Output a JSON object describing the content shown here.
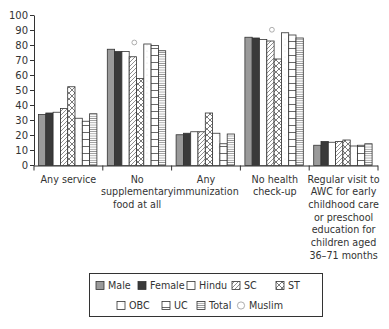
{
  "chart_data": {
    "type": "bar",
    "title": "",
    "xlabel": "",
    "ylabel": "",
    "ylim": [
      0,
      100
    ],
    "yticks": [
      0,
      10,
      20,
      30,
      40,
      50,
      60,
      70,
      80,
      90,
      100
    ],
    "grid": false,
    "legend_position": "bottom",
    "categories": [
      [
        "Any service"
      ],
      [
        "No",
        "supplementary",
        "food at all"
      ],
      [
        "Any",
        "immunization"
      ],
      [
        "No health",
        "check-up"
      ],
      [
        "Regular visit to",
        "AWC for early",
        "childhood care",
        "or preschool",
        "education for",
        "children aged",
        "36–71 months"
      ]
    ],
    "series": [
      {
        "name": "Male",
        "pattern": "gray-fill",
        "values": [
          34,
          77.5,
          20.5,
          85.5,
          13.5
        ]
      },
      {
        "name": "Female",
        "pattern": "dark-fill",
        "values": [
          35,
          76,
          21.5,
          85,
          16
        ]
      },
      {
        "name": "Hindu",
        "pattern": "white",
        "values": [
          35.5,
          76,
          22.5,
          84,
          15.5
        ]
      },
      {
        "name": "SC",
        "pattern": "diagonal-hatch",
        "values": [
          38,
          72.5,
          22.5,
          83,
          16
        ]
      },
      {
        "name": "ST",
        "pattern": "cross-hatch",
        "values": [
          52.5,
          58,
          35,
          71,
          17
        ]
      },
      {
        "name": "OBC",
        "pattern": "white-dotted",
        "values": [
          31.5,
          81,
          21.5,
          88.5,
          13
        ]
      },
      {
        "name": "UC",
        "pattern": "horizontal-lines",
        "values": [
          29.5,
          80,
          14.5,
          87,
          13.5
        ]
      },
      {
        "name": "Total",
        "pattern": "dense-horizontal",
        "values": [
          34.5,
          76.5,
          21,
          85,
          14.5
        ]
      }
    ],
    "markers": [
      {
        "name": "Muslim",
        "marker": "open-circle",
        "values": [
          null,
          82,
          null,
          90.5,
          null
        ]
      }
    ],
    "legend": {
      "rows": [
        [
          "Male",
          "Female",
          "Hindu",
          "SC",
          "ST"
        ],
        [
          "OBC",
          "UC",
          "Total",
          "Muslim"
        ]
      ]
    },
    "colors": {
      "axis": "#333333",
      "male": "#9a9a9a",
      "female": "#3a3a3a",
      "outline": "#333333"
    }
  }
}
